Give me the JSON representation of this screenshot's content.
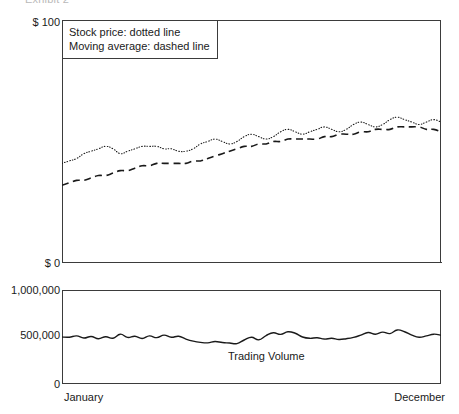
{
  "caption": "Exhibit 2",
  "chart_data": {
    "type": "line",
    "title": "Exhibit 2",
    "panels": [
      {
        "name": "price-panel",
        "ylabel": "",
        "xlabel": "",
        "ylim": [
          0,
          100
        ],
        "ytick_labels": [
          "$ 100",
          "$ 0"
        ],
        "grid": false,
        "legend_position": "top-left",
        "legend": [
          "Stock price: dotted line",
          "Moving average: dashed line"
        ],
        "x": [
          0,
          1,
          2,
          3,
          4,
          5,
          6,
          7,
          8,
          9,
          10,
          11,
          12,
          13,
          14,
          15,
          16,
          17,
          18,
          19,
          20,
          21,
          22,
          23,
          24,
          25,
          26,
          27,
          28,
          29,
          30,
          31,
          32,
          33,
          34,
          35,
          36,
          37,
          38,
          39,
          40,
          41,
          42,
          43,
          44,
          45,
          46,
          47,
          48,
          49,
          50,
          51,
          52
        ],
        "series": [
          {
            "name": "Stock price",
            "style": "dotted",
            "values": [
              41,
              42,
              43,
              45,
              46,
              47,
              48,
              47,
              45,
              46,
              47,
              48,
              48,
              48,
              47,
              47,
              46,
              46,
              47,
              49,
              50,
              51,
              50,
              49,
              50,
              52,
              53,
              52,
              51,
              52,
              54,
              55,
              54,
              53,
              54,
              55,
              56,
              55,
              54,
              55,
              57,
              58,
              57,
              56,
              57,
              59,
              60,
              59,
              58,
              57,
              58,
              59,
              58
            ]
          },
          {
            "name": "Moving average",
            "style": "dashed",
            "values": [
              32,
              33,
              34,
              34,
              35,
              36,
              36,
              37,
              38,
              38,
              39,
              40,
              40,
              41,
              41,
              41,
              41,
              41,
              42,
              42,
              43,
              44,
              45,
              46,
              47,
              48,
              48,
              49,
              49,
              50,
              50,
              51,
              51,
              51,
              51,
              51,
              52,
              52,
              53,
              53,
              53,
              54,
              54,
              55,
              55,
              55,
              56,
              56,
              56,
              56,
              55,
              55,
              54
            ]
          }
        ]
      },
      {
        "name": "volume-panel",
        "ylabel": "",
        "xlabel": "",
        "ylim": [
          0,
          1000000
        ],
        "ytick_labels": [
          "1,000,000",
          "500,000",
          "0"
        ],
        "grid": false,
        "annotation": "Trading Volume",
        "x": [
          0,
          1,
          2,
          3,
          4,
          5,
          6,
          7,
          8,
          9,
          10,
          11,
          12,
          13,
          14,
          15,
          16,
          17,
          18,
          19,
          20,
          21,
          22,
          23,
          24,
          25,
          26,
          27,
          28,
          29,
          30,
          31,
          32,
          33,
          34,
          35,
          36,
          37,
          38,
          39,
          40,
          41,
          42,
          43,
          44,
          45,
          46,
          47,
          48,
          49,
          50,
          51,
          52
        ],
        "series": [
          {
            "name": "Trading Volume",
            "style": "solid",
            "values": [
              500000,
              498000,
              512000,
              489000,
              506000,
              482000,
              503000,
              487000,
              530000,
              496000,
              508000,
              484000,
              512000,
              493000,
              520000,
              497000,
              508000,
              478000,
              456000,
              443000,
              438000,
              452000,
              441000,
              436000,
              430000,
              468000,
              498000,
              470000,
              515000,
              545000,
              528000,
              556000,
              540000,
              500000,
              486000,
              492000,
              478000,
              486000,
              474000,
              482000,
              496000,
              520000,
              548000,
              530000,
              552000,
              536000,
              575000,
              556000,
              520000,
              498000,
              512000,
              530000,
              520000
            ]
          }
        ]
      }
    ],
    "x_tick_labels": [
      "January",
      "December"
    ]
  },
  "axis": {
    "price_top": "$ 100",
    "price_zero": "$ 0",
    "volume_top": "1,000,000",
    "volume_mid": "500,000",
    "volume_zero": "0",
    "x_start": "January",
    "x_end": "December"
  },
  "legend": {
    "line1": "Stock price: dotted line",
    "line2": "Moving average: dashed line"
  },
  "annotations": {
    "volume": "Trading Volume"
  }
}
